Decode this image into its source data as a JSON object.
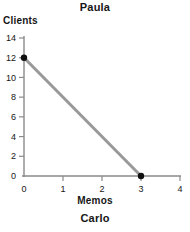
{
  "chart_data": {
    "type": "line",
    "title": "Paula",
    "caption": "Carlo",
    "xlabel": "Memos",
    "ylabel": "Clients",
    "xlim": [
      0,
      4
    ],
    "ylim": [
      0,
      14
    ],
    "xticks": [
      0,
      1,
      2,
      3,
      4
    ],
    "yticks": [
      0,
      2,
      4,
      6,
      8,
      10,
      12,
      14
    ],
    "xtick_labels": [
      "0",
      "1",
      "2",
      "3",
      "4"
    ],
    "ytick_labels": [
      "0",
      "2",
      "4",
      "6",
      "8",
      "10",
      "12",
      "14"
    ],
    "grid": false,
    "legend": false,
    "series": [
      {
        "name": "Production possibilities frontier",
        "x": [
          0,
          3
        ],
        "y": [
          12,
          0
        ],
        "line_color": "#999999",
        "line_width": 3,
        "marker": "circle",
        "marker_color": "#101010",
        "points": [
          {
            "x": 0,
            "y": 12
          },
          {
            "x": 3,
            "y": 0
          }
        ]
      }
    ],
    "axis_color": "#8a8a8a",
    "text_color": "#161616"
  }
}
